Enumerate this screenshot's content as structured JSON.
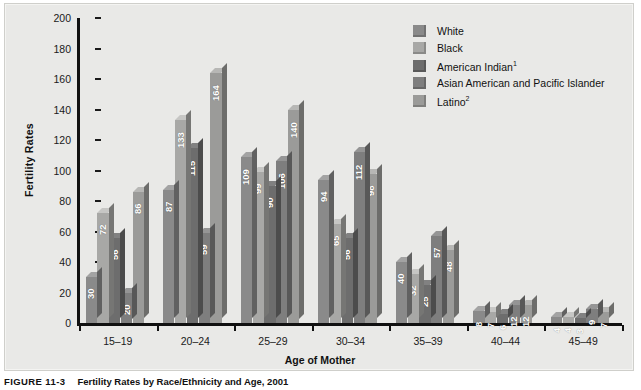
{
  "chart_data": {
    "type": "bar",
    "title": "Fertility Rates by Race/Ethnicity and Age, 2001",
    "xlabel": "Age of Mother",
    "ylabel": "Fertility Rates",
    "categories": [
      "15–19",
      "20–24",
      "25–29",
      "30–34",
      "35–39",
      "40–44",
      "45–49"
    ],
    "ylim": [
      0,
      200
    ],
    "yticks": [
      0,
      20,
      40,
      60,
      80,
      100,
      120,
      140,
      160,
      180,
      200
    ],
    "grid": false,
    "legend_position": "top-right",
    "series": [
      {
        "name": "White",
        "color": "#8a8a8a",
        "values": [
          30,
          87,
          109,
          94,
          40,
          8,
          4
        ]
      },
      {
        "name": "Black",
        "color": "#a8a8a6",
        "values": [
          72,
          133,
          99,
          65,
          32,
          7,
          4
        ]
      },
      {
        "name": "American Indian",
        "footnote": "1",
        "color": "#6d6d6d",
        "values": [
          56,
          115,
          90,
          56,
          25,
          6,
          3
        ]
      },
      {
        "name": "Asian American and Pacific Islander",
        "color": "#7e7e7e",
        "values": [
          20,
          59,
          106,
          112,
          57,
          12,
          9
        ]
      },
      {
        "name": "Latino",
        "footnote": "2",
        "color": "#9b9b99",
        "values": [
          86,
          164,
          140,
          98,
          48,
          12,
          7
        ]
      }
    ]
  },
  "legend": {
    "items": [
      {
        "label": "White",
        "sup": ""
      },
      {
        "label": "Black",
        "sup": ""
      },
      {
        "label": "American Indian",
        "sup": "1"
      },
      {
        "label": "Asian American and Pacific Islander",
        "sup": ""
      },
      {
        "label": "Latino",
        "sup": "2"
      }
    ]
  },
  "caption": {
    "number": "FIGURE 11-3",
    "text": "Fertility Rates by Race/Ethnicity and Age, 2001"
  }
}
